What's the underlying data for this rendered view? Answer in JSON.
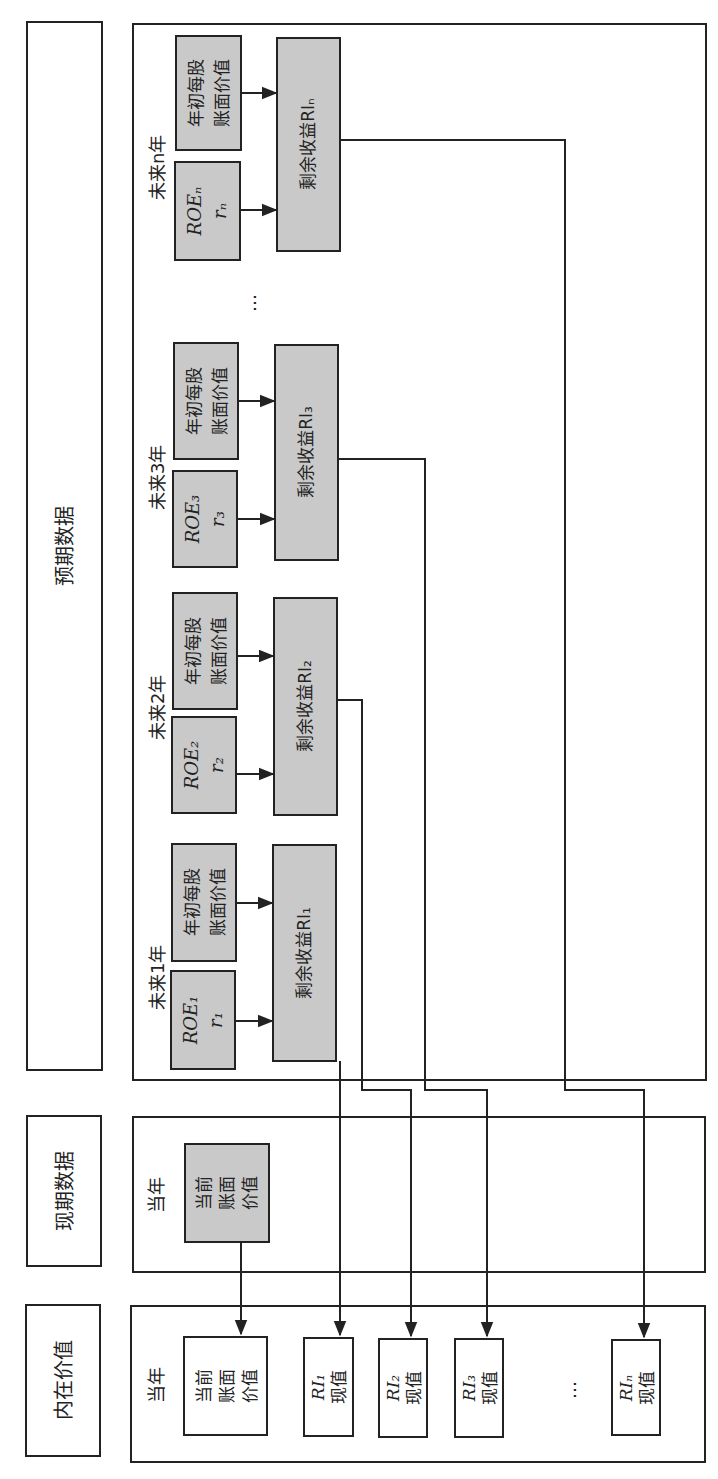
{
  "sections": {
    "expected": "预期数据",
    "current": "现期数据",
    "intrinsic": "内在价值"
  },
  "current_year_label": "当年",
  "current_book": [
    "当前",
    "账面",
    "价值"
  ],
  "future_years": [
    {
      "label": "未来1年",
      "roe": "ROE₁",
      "r": "r₁",
      "bv": [
        "年初每股",
        "账面价值"
      ],
      "ri": "剩余收益RI₁"
    },
    {
      "label": "未来2年",
      "roe": "ROE₂",
      "r": "r₂",
      "bv": [
        "年初每股",
        "账面价值"
      ],
      "ri": "剩余收益RI₂"
    },
    {
      "label": "未来3年",
      "roe": "ROE₃",
      "r": "r₃",
      "bv": [
        "年初每股",
        "账面价值"
      ],
      "ri": "剩余收益RI₃"
    },
    {
      "label": "未来n年",
      "roe": "ROEₙ",
      "r": "rₙ",
      "bv": [
        "年初每股",
        "账面价值"
      ],
      "ri": "剩余收益RIₙ"
    }
  ],
  "ellipsis": "…",
  "intrinsic_items": [
    {
      "lines": [
        "当前",
        "账面",
        "价值"
      ]
    },
    {
      "lines": [
        "RI₁",
        "现值"
      ]
    },
    {
      "lines": [
        "RI₂",
        "现值"
      ]
    },
    {
      "lines": [
        "RI₃",
        "现值"
      ]
    },
    {
      "lines": [
        "RIₙ",
        "现值"
      ]
    }
  ],
  "colors": {
    "box_fill": "#c9c9c9",
    "line": "#222222"
  }
}
